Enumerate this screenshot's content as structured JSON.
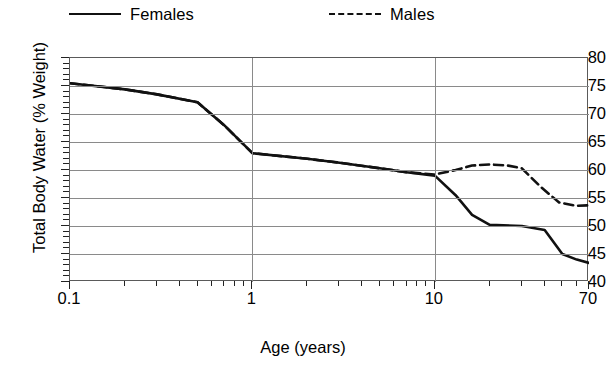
{
  "legend": {
    "position": "top",
    "items": [
      {
        "label": "Females",
        "style": "solid",
        "icon": "solid-line-icon"
      },
      {
        "label": "Males",
        "style": "dashed",
        "icon": "dashed-line-icon"
      }
    ]
  },
  "axes": {
    "xlabel": "Age (years)",
    "ylabel": "Total Body Water (% Weight)",
    "x_tick_labels": [
      "0.1",
      "1",
      "10",
      "70"
    ],
    "y_tick_labels": [
      "80",
      "75",
      "70",
      "65",
      "60",
      "55",
      "50",
      "45",
      "40"
    ]
  },
  "chart_data": {
    "type": "line",
    "title": "",
    "xlabel": "Age (years)",
    "ylabel": "Total Body Water (% Weight)",
    "xscale": "log",
    "xlim": [
      0.1,
      70
    ],
    "ylim": [
      40,
      80
    ],
    "yticks": [
      40,
      45,
      50,
      55,
      60,
      65,
      70,
      75,
      80
    ],
    "xticks": [
      0.1,
      1,
      10,
      70
    ],
    "grid": "horizontal-and-vertical-major",
    "legend_position": "top",
    "series": [
      {
        "name": "Females",
        "style": "solid",
        "color": "#111111",
        "points": [
          {
            "x": 0.1,
            "y": 75.5
          },
          {
            "x": 0.2,
            "y": 74.4
          },
          {
            "x": 0.3,
            "y": 73.5
          },
          {
            "x": 0.5,
            "y": 72.1
          },
          {
            "x": 0.7,
            "y": 68.0
          },
          {
            "x": 1.0,
            "y": 63.0
          },
          {
            "x": 2.0,
            "y": 62.0
          },
          {
            "x": 3.0,
            "y": 61.3
          },
          {
            "x": 5.0,
            "y": 60.3
          },
          {
            "x": 7.0,
            "y": 59.6
          },
          {
            "x": 10.0,
            "y": 59.0
          },
          {
            "x": 13.0,
            "y": 55.5
          },
          {
            "x": 16.0,
            "y": 52.0
          },
          {
            "x": 20.0,
            "y": 50.2
          },
          {
            "x": 30.0,
            "y": 50.0
          },
          {
            "x": 40.0,
            "y": 49.3
          },
          {
            "x": 50.0,
            "y": 45.0
          },
          {
            "x": 60.0,
            "y": 44.0
          },
          {
            "x": 70.0,
            "y": 43.4
          }
        ]
      },
      {
        "name": "Males",
        "style": "dashed",
        "color": "#111111",
        "points": [
          {
            "x": 0.1,
            "y": 75.5
          },
          {
            "x": 0.2,
            "y": 74.4
          },
          {
            "x": 0.3,
            "y": 73.5
          },
          {
            "x": 0.5,
            "y": 72.1
          },
          {
            "x": 0.7,
            "y": 68.0
          },
          {
            "x": 1.0,
            "y": 63.0
          },
          {
            "x": 2.0,
            "y": 62.0
          },
          {
            "x": 3.0,
            "y": 61.3
          },
          {
            "x": 5.0,
            "y": 60.3
          },
          {
            "x": 7.0,
            "y": 59.6
          },
          {
            "x": 10.0,
            "y": 59.2
          },
          {
            "x": 13.0,
            "y": 60.0
          },
          {
            "x": 16.0,
            "y": 60.8
          },
          {
            "x": 20.0,
            "y": 61.0
          },
          {
            "x": 25.0,
            "y": 60.8
          },
          {
            "x": 30.0,
            "y": 60.3
          },
          {
            "x": 38.0,
            "y": 57.0
          },
          {
            "x": 48.0,
            "y": 54.2
          },
          {
            "x": 60.0,
            "y": 53.6
          },
          {
            "x": 70.0,
            "y": 53.7
          }
        ]
      }
    ]
  }
}
